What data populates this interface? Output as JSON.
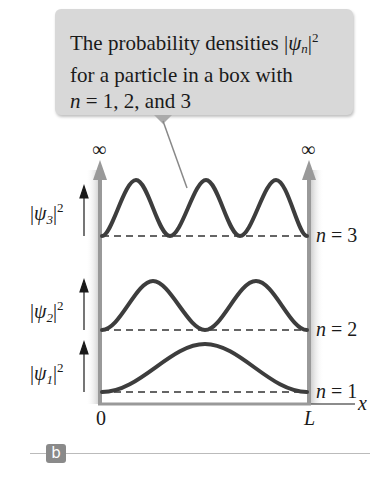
{
  "callout": {
    "line1_prefix": "The probability densities |",
    "psi": "ψ",
    "sub_n": "n",
    "line1_suffix": "|",
    "sup2": "2",
    "line2": "for a particle in a box with",
    "line3_n": "n",
    "line3_rest": " = 1, 2, and 3"
  },
  "labels": {
    "infinity_left": "∞",
    "infinity_right": "∞",
    "psi": "ψ",
    "psi3_sub": "3",
    "psi2_sub": "2",
    "psi1_sub": "1",
    "sup2": "2",
    "n": "n",
    "n3_rest": " = 3",
    "n2_rest": " = 2",
    "n1_rest": " = 1",
    "x_axis": "x",
    "origin": "0",
    "L": "L",
    "panel": "b"
  },
  "colors": {
    "curve": "#3d3d3d",
    "wall": "#999999",
    "callout_bg": "#d8d8d8",
    "panel_tag": "#8a8a8a"
  }
}
